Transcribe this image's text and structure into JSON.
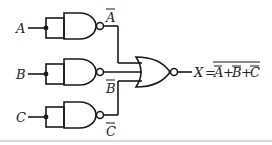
{
  "diagram": {
    "type": "logic-circuit",
    "inputs": [
      {
        "id": "A",
        "label": "A",
        "gate": "NAND",
        "output_label": "A"
      },
      {
        "id": "B",
        "label": "B",
        "gate": "NAND",
        "output_label": "B"
      },
      {
        "id": "C",
        "label": "C",
        "gate": "NAND",
        "output_label": "C"
      }
    ],
    "output_gate": "NOR",
    "output": {
      "lhs": "X",
      "eq": "=",
      "terms": [
        "A",
        "B",
        "C"
      ],
      "op": "+"
    },
    "colors": {
      "stroke": "#1a1a1a",
      "background": "#ffffff"
    }
  }
}
